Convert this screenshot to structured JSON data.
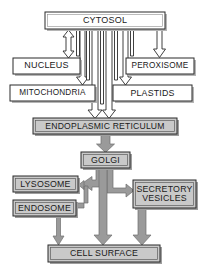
{
  "diagram": {
    "colors": {
      "background": "#ffffff",
      "outline": "#2b2b2b",
      "box_fill_white": "#ffffff",
      "box_fill_gray": "#c9c9c9",
      "arrow_fill_white": "#ffffff",
      "arrow_fill_gray": "#9a9a9a",
      "text": "#1a1a1a"
    },
    "nodes": [
      {
        "id": "cytosol",
        "label": "CYTOSOL",
        "style": "gray-3d",
        "x": 45,
        "y": 12,
        "w": 120,
        "h": 17,
        "font": 9
      },
      {
        "id": "nucleus",
        "label": "NUCLEUS",
        "style": "white",
        "x": 13,
        "y": 58,
        "w": 67,
        "h": 16,
        "font": 9
      },
      {
        "id": "peroxisome",
        "label": "PEROXISOME",
        "style": "white",
        "x": 126,
        "y": 58,
        "w": 68,
        "h": 16,
        "font": 8.2
      },
      {
        "id": "mitochondria",
        "label": "MITOCHONDRIA",
        "style": "white",
        "x": 10,
        "y": 85,
        "w": 85,
        "h": 16,
        "font": 8.2
      },
      {
        "id": "plastids",
        "label": "PLASTIDS",
        "style": "white",
        "x": 113,
        "y": 85,
        "w": 79,
        "h": 16,
        "font": 8.8
      },
      {
        "id": "er",
        "label": "ENDOPLASMIC RETICULUM",
        "style": "gray-3d",
        "x": 33,
        "y": 118,
        "w": 144,
        "h": 16,
        "font": 8.6
      },
      {
        "id": "golgi",
        "label": "GOLGI",
        "style": "gray-3d",
        "x": 81,
        "y": 152,
        "w": 49,
        "h": 16,
        "font": 8.8
      },
      {
        "id": "lysosome",
        "label": "LYSOSOME",
        "style": "gray-3d",
        "x": 13,
        "y": 176,
        "w": 65,
        "h": 16,
        "font": 8.8
      },
      {
        "id": "endosome",
        "label": "ENDOSOME",
        "style": "gray-3d",
        "x": 13,
        "y": 200,
        "w": 63,
        "h": 16,
        "font": 8.8
      },
      {
        "id": "secretory",
        "label": "SECRETORY\nVESICLES",
        "style": "gray-3d",
        "x": 133,
        "y": 180,
        "w": 63,
        "h": 28,
        "font": 8.8
      },
      {
        "id": "cellsurface",
        "label": "CELL SURFACE",
        "style": "gray-3d",
        "x": 48,
        "y": 245,
        "w": 112,
        "h": 17,
        "font": 8.8
      }
    ],
    "edges": [
      {
        "id": "cytosol-nucleus",
        "from": "cytosol",
        "to": "nucleus",
        "arrow": "double",
        "style": "outline"
      },
      {
        "id": "cytosol-peroxisome",
        "from": "cytosol",
        "to": "peroxisome",
        "arrow": "single",
        "style": "outline"
      },
      {
        "id": "cytosol-mitochondria",
        "from": "cytosol",
        "to": "mitochondria",
        "arrow": "single",
        "style": "outline"
      },
      {
        "id": "cytosol-plastids",
        "from": "cytosol",
        "to": "plastids",
        "arrow": "single",
        "style": "outline"
      },
      {
        "id": "cytosol-er",
        "from": "cytosol",
        "to": "er",
        "arrow": "single",
        "style": "outline"
      },
      {
        "id": "er-golgi",
        "from": "er",
        "to": "golgi",
        "arrow": "single",
        "style": "solid-gray"
      },
      {
        "id": "golgi-lysosome",
        "from": "golgi",
        "to": "lysosome",
        "arrow": "single",
        "style": "solid-gray"
      },
      {
        "id": "endosome-lysosome",
        "from": "endosome",
        "to": "lysosome",
        "arrow": "single",
        "style": "solid-gray"
      },
      {
        "id": "golgi-secretory",
        "from": "golgi",
        "to": "secretory",
        "arrow": "single",
        "style": "solid-gray"
      },
      {
        "id": "golgi-cellsurface",
        "from": "golgi",
        "to": "cellsurface",
        "arrow": "single",
        "style": "solid-gray"
      },
      {
        "id": "secretory-cellsurface",
        "from": "secretory",
        "to": "cellsurface",
        "arrow": "single",
        "style": "solid-gray"
      },
      {
        "id": "cellsurface-endosome",
        "from": "cellsurface",
        "to": "endosome",
        "arrow": "single",
        "style": "solid-gray"
      }
    ]
  }
}
